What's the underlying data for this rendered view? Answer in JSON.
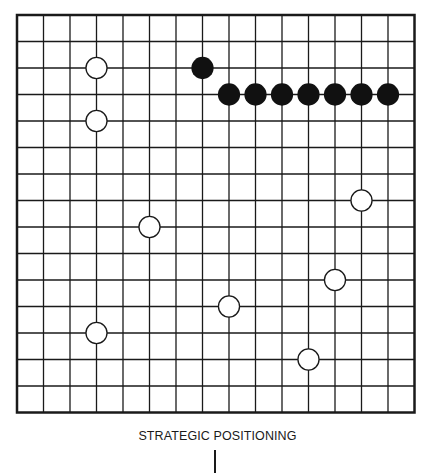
{
  "diagram": {
    "title": "STRATEGIC POSITIONING",
    "board": {
      "lines": 16,
      "origin_x": 17,
      "origin_y": 15,
      "spacing": 26.5,
      "line_color": "#1a1a1a",
      "border_width": 2.5,
      "line_width": 1.3
    },
    "stones": {
      "black": [
        {
          "col": 7,
          "row": 2
        },
        {
          "col": 8,
          "row": 3
        },
        {
          "col": 9,
          "row": 3
        },
        {
          "col": 10,
          "row": 3
        },
        {
          "col": 11,
          "row": 3
        },
        {
          "col": 12,
          "row": 3
        },
        {
          "col": 13,
          "row": 3
        },
        {
          "col": 14,
          "row": 3
        }
      ],
      "white": [
        {
          "col": 3,
          "row": 2
        },
        {
          "col": 3,
          "row": 4
        },
        {
          "col": 13,
          "row": 7
        },
        {
          "col": 5,
          "row": 8
        },
        {
          "col": 12,
          "row": 10
        },
        {
          "col": 8,
          "row": 11
        },
        {
          "col": 3,
          "row": 12
        },
        {
          "col": 11,
          "row": 13
        }
      ]
    },
    "colors": {
      "black_stone": "#111111",
      "white_stone_fill": "#ffffff",
      "white_stone_stroke": "#1a1a1a"
    }
  }
}
